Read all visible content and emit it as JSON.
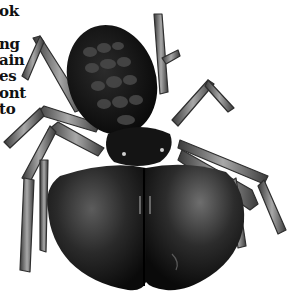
{
  "image": {
    "subject": "solifuge (camel spider) illustration, dorsal view",
    "style": "grayscale scientific engraving",
    "background_color": "#ffffff"
  },
  "cropped_text": {
    "lines": [
      {
        "text": "ok",
        "top": 4
      },
      {
        "text": "ng",
        "top": 37
      },
      {
        "text": "ain",
        "top": 53
      },
      {
        "text": "es",
        "top": 69
      },
      {
        "text": "ont",
        "top": 86
      },
      {
        "text": "to",
        "top": 102
      }
    ]
  },
  "colors": {
    "body_dark": "#0d0d0d",
    "body_mid": "#2a2a2a",
    "segment_highlight": "#5a5a5a",
    "leg_fill": "#8a8a8a",
    "leg_edge": "#2e2e2e",
    "chelicera_highlight": "#6b6b6b"
  }
}
